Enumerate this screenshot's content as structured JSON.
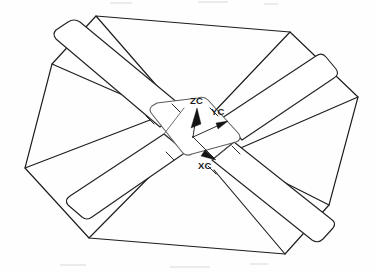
{
  "figure": {
    "background_color": "#fefefe",
    "line_color": "#1c1c1c",
    "hub_line_color": "#5d5d5d",
    "label_color": "#1a1a1a"
  },
  "axes": {
    "origin": {
      "x": 193,
      "y": 137
    },
    "items": [
      {
        "name": "zc",
        "label": "ZC",
        "label_x": 190,
        "label_y": 104,
        "tip_x": 197,
        "tip_y": 108,
        "direction": "up"
      },
      {
        "name": "yc",
        "label": "YC",
        "label_x": 211,
        "label_y": 115,
        "tip_x": 226,
        "tip_y": 122,
        "direction": "right-up"
      },
      {
        "name": "xc",
        "label": "XC",
        "label_x": 198,
        "label_y": 169,
        "tip_x": 215,
        "tip_y": 159,
        "direction": "down-right"
      }
    ]
  },
  "geometry": {
    "perimeter": {
      "name": "outer-octagon",
      "points": "96,16 290,32 358,97 329,205 285,254 89,238 25,168 52,64"
    },
    "beam_a": {
      "name": "beam-upper-left-to-lower-right",
      "outer": "60,28 96,16 310,185 288,208",
      "inner": "60,28 86,34 300,200 288,208"
    },
    "beam_b": {
      "name": "beam-lower-left-to-upper-right",
      "outer": "75,190 100,215 326,64 306,48",
      "inner": "75,190 92,196 318,55 306,48"
    },
    "hub": {
      "name": "central-hub",
      "outline": "148,104 201,99 241,158 189,175"
    },
    "braces": [
      {
        "name": "brace-nw",
        "path": "52,64 193,137"
      },
      {
        "name": "brace-ne",
        "path": "358,97 193,137"
      },
      {
        "name": "brace-sw",
        "path": "25,168 193,137"
      },
      {
        "name": "brace-se",
        "path": "329,205 193,137"
      },
      {
        "name": "brace-n",
        "path": "96,16 193,137"
      },
      {
        "name": "brace-s",
        "path": "285,254 193,137"
      },
      {
        "name": "brace-e",
        "path": "290,32 193,137"
      },
      {
        "name": "brace-w",
        "path": "89,238 193,137"
      }
    ]
  }
}
